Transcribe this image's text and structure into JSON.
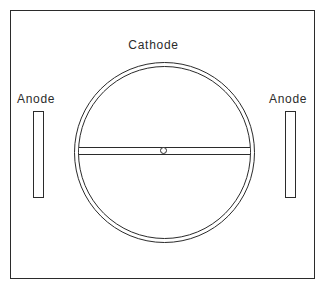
{
  "diagram": {
    "frame": {
      "name": "apparatus-outline"
    },
    "labels": {
      "cathode": "Cathode",
      "anode_left": "Anode",
      "anode_right": "Anode"
    },
    "components": {
      "cathode": {
        "shape": "concentric-circle",
        "rings": 2
      },
      "filament_bar": {
        "shape": "horizontal-hollow-bar"
      },
      "center_marker": {
        "shape": "small-circle"
      },
      "anode_left": {
        "shape": "vertical-rectangle"
      },
      "anode_right": {
        "shape": "vertical-rectangle"
      }
    },
    "colors": {
      "stroke": "#2b2b2b",
      "background": "#ffffff"
    }
  }
}
